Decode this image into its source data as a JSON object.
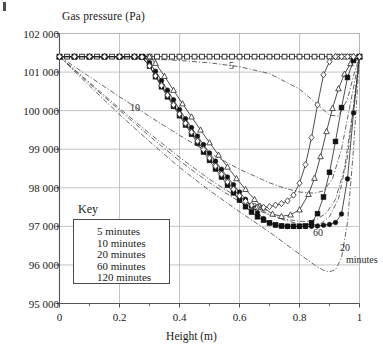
{
  "figure": {
    "corner_mark": "crop-artifact-mark",
    "background": "#ffffff",
    "ink": "#1a1a1a",
    "grid_color": "#b5b5b5"
  },
  "chart_data": {
    "type": "line",
    "title": "",
    "ylabel": "Gas pressure (Pa)",
    "xlabel": "Height (m)",
    "xlim": [
      0,
      1
    ],
    "ylim": [
      95000,
      102000
    ],
    "grid": true,
    "x_ticks": [
      0,
      0.2,
      0.4,
      0.6,
      0.8,
      1
    ],
    "x_tick_labels": [
      "0",
      "0.2",
      "0.4",
      "0.6",
      "0.8",
      "1"
    ],
    "x_minor_ticks": [
      0.1,
      0.3,
      0.5,
      0.7,
      0.9
    ],
    "y_ticks": [
      95000,
      96000,
      97000,
      98000,
      99000,
      100000,
      101000,
      102000
    ],
    "y_tick_labels": [
      "95 000",
      "96 000",
      "97 000",
      "98 000",
      "99 000",
      "100 000",
      "101 000",
      "102 000"
    ],
    "legend": {
      "title": "Key",
      "position": "inside-lower-left",
      "entries": [
        {
          "label": "5 minutes",
          "marker": "open-square"
        },
        {
          "label": "10 minutes",
          "marker": "filled-circle"
        },
        {
          "label": "20 minutes",
          "marker": "open-triangle"
        },
        {
          "label": "60 minutes",
          "marker": "filled-square"
        },
        {
          "label": "120 minutes",
          "marker": "open-diamond"
        }
      ]
    },
    "annotations": [
      {
        "text": "5",
        "x": 0.565,
        "y": 101150,
        "note": "label on 5-minute dash-dot model curve"
      },
      {
        "text": "10",
        "x": 0.235,
        "y": 100070,
        "note": "label on 10-minute dash-dot model curve"
      },
      {
        "text": "120",
        "x": 0.625,
        "y": 97510,
        "note": "label on 120-minute dash-dot model curve"
      },
      {
        "text": "60",
        "x": 0.845,
        "y": 96830,
        "note": "label on 60-minute dash-dot model curve"
      },
      {
        "text": "20",
        "x": 0.935,
        "y": 96440,
        "note": "label on 20-minute dash-dot model curve"
      },
      {
        "text": "minutes",
        "x": 0.955,
        "y": 96130,
        "note": "continuation of 20 minutes label"
      }
    ],
    "series": [
      {
        "name": "5 minutes",
        "marker": "open-square",
        "line": "solid",
        "x": [
          0,
          0.025,
          0.05,
          0.075,
          0.1,
          0.125,
          0.15,
          0.175,
          0.2,
          0.225,
          0.25,
          0.275,
          0.3,
          0.325,
          0.35,
          0.375,
          0.4,
          0.425,
          0.45,
          0.475,
          0.5,
          0.525,
          0.55,
          0.575,
          0.6,
          0.625,
          0.65,
          0.675,
          0.7,
          0.725,
          0.75,
          0.775,
          0.8,
          0.825,
          0.85,
          0.875,
          0.9,
          0.925,
          0.95,
          0.975,
          1
        ],
        "y": [
          101400,
          101400,
          101400,
          101400,
          101400,
          101400,
          101400,
          101400,
          101400,
          101400,
          101400,
          101400,
          101400,
          101400,
          101400,
          101400,
          101400,
          101400,
          101400,
          101400,
          101400,
          101400,
          101400,
          101400,
          101400,
          101400,
          101400,
          101400,
          101400,
          101400,
          101400,
          101400,
          101400,
          101400,
          101400,
          101400,
          101400,
          101400,
          101400,
          101400,
          101400
        ]
      },
      {
        "name": "10 minutes",
        "marker": "filled-circle",
        "line": "solid",
        "x": [
          0,
          0.05,
          0.1,
          0.15,
          0.2,
          0.25,
          0.28,
          0.3,
          0.32,
          0.34,
          0.36,
          0.38,
          0.4,
          0.42,
          0.44,
          0.46,
          0.48,
          0.5,
          0.52,
          0.54,
          0.56,
          0.58,
          0.6,
          0.62,
          0.64,
          0.66,
          0.68,
          0.7,
          0.72,
          0.74,
          0.76,
          0.78,
          0.8,
          0.82,
          0.84,
          0.86,
          0.88,
          0.9,
          0.92,
          0.94,
          0.96,
          0.98,
          1
        ],
        "y": [
          101400,
          101400,
          101400,
          101400,
          101400,
          101400,
          101400,
          101250,
          101020,
          100780,
          100530,
          100280,
          100030,
          99790,
          99560,
          99340,
          99120,
          98900,
          98690,
          98480,
          98280,
          98080,
          97890,
          97700,
          97520,
          97350,
          97200,
          97090,
          97030,
          97010,
          97000,
          97000,
          97000,
          97000,
          97000,
          97010,
          97030,
          97050,
          97100,
          97320,
          98230,
          99940,
          101400
        ]
      },
      {
        "name": "20 minutes",
        "marker": "open-triangle",
        "line": "solid",
        "x": [
          0,
          0.05,
          0.1,
          0.15,
          0.2,
          0.25,
          0.3,
          0.32,
          0.35,
          0.38,
          0.41,
          0.44,
          0.47,
          0.5,
          0.53,
          0.56,
          0.59,
          0.62,
          0.65,
          0.68,
          0.71,
          0.74,
          0.77,
          0.8,
          0.83,
          0.85,
          0.87,
          0.89,
          0.91,
          0.93,
          0.95,
          0.97,
          0.99,
          1
        ],
        "y": [
          101400,
          101400,
          101400,
          101400,
          101400,
          101400,
          101400,
          101230,
          100890,
          100530,
          100180,
          99840,
          99500,
          99170,
          98850,
          98540,
          98240,
          97960,
          97700,
          97480,
          97320,
          97260,
          97300,
          97430,
          97830,
          98250,
          98810,
          99460,
          100060,
          100570,
          100950,
          101220,
          101370,
          101400
        ]
      },
      {
        "name": "60 minutes",
        "marker": "filled-square",
        "line": "solid",
        "x": [
          0,
          0.05,
          0.1,
          0.15,
          0.2,
          0.25,
          0.275,
          0.3,
          0.32,
          0.34,
          0.36,
          0.38,
          0.4,
          0.42,
          0.44,
          0.46,
          0.48,
          0.5,
          0.52,
          0.54,
          0.56,
          0.58,
          0.6,
          0.62,
          0.64,
          0.66,
          0.68,
          0.7,
          0.72,
          0.74,
          0.76,
          0.78,
          0.8,
          0.82,
          0.84,
          0.86,
          0.88,
          0.9,
          0.92,
          0.94,
          0.96,
          0.98,
          1
        ],
        "y": [
          101400,
          101400,
          101400,
          101400,
          101400,
          101400,
          101390,
          101150,
          100880,
          100620,
          100360,
          100110,
          99870,
          99630,
          99390,
          99160,
          98930,
          98710,
          98490,
          98280,
          98070,
          97870,
          97680,
          97510,
          97370,
          97250,
          97160,
          97090,
          97040,
          97010,
          97000,
          97000,
          97000,
          97010,
          97090,
          97330,
          97760,
          98400,
          99200,
          100080,
          100860,
          101300,
          101400
        ]
      },
      {
        "name": "120 minutes",
        "marker": "open-diamond",
        "line": "solid",
        "x": [
          0,
          0.05,
          0.1,
          0.15,
          0.2,
          0.25,
          0.275,
          0.3,
          0.32,
          0.34,
          0.36,
          0.38,
          0.4,
          0.42,
          0.44,
          0.46,
          0.48,
          0.5,
          0.52,
          0.54,
          0.56,
          0.58,
          0.6,
          0.62,
          0.64,
          0.66,
          0.68,
          0.7,
          0.72,
          0.74,
          0.76,
          0.78,
          0.8,
          0.82,
          0.84,
          0.86,
          0.88,
          0.9,
          0.92,
          0.94,
          0.96,
          0.98,
          1
        ],
        "y": [
          101400,
          101400,
          101400,
          101400,
          101400,
          101400,
          101390,
          101160,
          100900,
          100650,
          100400,
          100150,
          99910,
          99670,
          99440,
          99210,
          98990,
          98770,
          98560,
          98350,
          98150,
          97960,
          97790,
          97650,
          97550,
          97500,
          97490,
          97510,
          97550,
          97590,
          97660,
          97810,
          98120,
          98600,
          99300,
          100150,
          100930,
          101270,
          101400,
          101400,
          101400,
          101400,
          101400
        ]
      },
      {
        "name": "5 minutes model",
        "marker": "none",
        "line": "dash-dot",
        "x": [
          0,
          0.1,
          0.2,
          0.3,
          0.4,
          0.5,
          0.6,
          0.7,
          0.8,
          0.85,
          0.9,
          0.93,
          0.96,
          0.98,
          1
        ],
        "y": [
          101400,
          101390,
          101370,
          101340,
          101300,
          101240,
          101140,
          100960,
          100560,
          100230,
          99880,
          99860,
          100300,
          100900,
          101400
        ]
      },
      {
        "name": "10 minutes model",
        "marker": "none",
        "line": "dash-dot",
        "x": [
          0,
          0.1,
          0.2,
          0.3,
          0.4,
          0.5,
          0.6,
          0.7,
          0.75,
          0.8,
          0.85,
          0.88,
          0.91,
          0.94,
          0.97,
          1
        ],
        "y": [
          101400,
          100880,
          100360,
          99850,
          99360,
          98900,
          98480,
          98130,
          97990,
          97890,
          97860,
          97920,
          98230,
          99000,
          100200,
          101400
        ]
      },
      {
        "name": "20 minutes model",
        "marker": "none",
        "line": "dash-dot",
        "x": [
          0,
          0.1,
          0.2,
          0.3,
          0.4,
          0.5,
          0.6,
          0.7,
          0.8,
          0.85,
          0.88,
          0.9,
          0.92,
          0.94,
          0.96,
          0.98,
          1
        ],
        "y": [
          101400,
          100640,
          99900,
          99200,
          98530,
          97930,
          97380,
          96850,
          96280,
          96000,
          95860,
          95820,
          95880,
          96180,
          97100,
          99000,
          101400
        ]
      },
      {
        "name": "60 minutes model",
        "marker": "none",
        "line": "dash-dot",
        "x": [
          0,
          0.1,
          0.2,
          0.3,
          0.4,
          0.5,
          0.6,
          0.7,
          0.75,
          0.8,
          0.84,
          0.87,
          0.9,
          0.93,
          0.96,
          0.98,
          1
        ],
        "y": [
          101400,
          100730,
          100060,
          99410,
          98790,
          98220,
          97720,
          97310,
          97160,
          97060,
          97030,
          97070,
          97250,
          97720,
          98800,
          100100,
          101400
        ]
      },
      {
        "name": "120 minutes model",
        "marker": "none",
        "line": "dash-dot",
        "x": [
          0,
          0.1,
          0.2,
          0.3,
          0.4,
          0.5,
          0.6,
          0.65,
          0.7,
          0.75,
          0.8,
          0.83,
          0.86,
          0.89,
          0.92,
          0.95,
          0.98,
          1
        ],
        "y": [
          101400,
          100700,
          100010,
          99340,
          98700,
          98130,
          97640,
          97450,
          97300,
          97190,
          97130,
          97130,
          97190,
          97350,
          97700,
          98500,
          100100,
          101400
        ]
      }
    ]
  }
}
